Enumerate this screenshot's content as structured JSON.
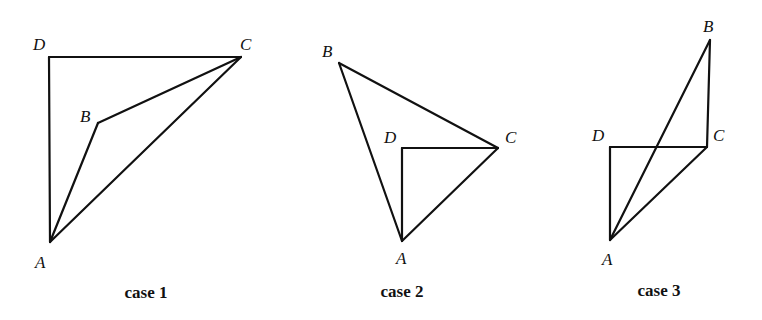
{
  "figure": {
    "cases": [
      {
        "caption": "case 1",
        "caption_pos": [
          146,
          298
        ],
        "points": {
          "A": [
            50,
            242
          ],
          "B": [
            98,
            123
          ],
          "C": [
            241,
            57
          ],
          "D": [
            49,
            57
          ]
        },
        "labels": {
          "A": {
            "text": "A",
            "pos": [
              35,
              268
            ]
          },
          "B": {
            "text": "B",
            "pos": [
              80,
              122
            ]
          },
          "C": {
            "text": "C",
            "pos": [
              240,
              50
            ]
          },
          "D": {
            "text": "D",
            "pos": [
              33,
              50
            ]
          }
        },
        "edges": [
          [
            "D",
            "C"
          ],
          [
            "D",
            "A"
          ],
          [
            "A",
            "B"
          ],
          [
            "B",
            "C"
          ],
          [
            "A",
            "C"
          ]
        ]
      },
      {
        "caption": "case 2",
        "caption_pos": [
          402,
          297
        ],
        "points": {
          "A": [
            402,
            241
          ],
          "B": [
            339,
            63
          ],
          "C": [
            498,
            148
          ],
          "D": [
            402,
            148
          ]
        },
        "labels": {
          "A": {
            "text": "A",
            "pos": [
              396,
              264
            ]
          },
          "B": {
            "text": "B",
            "pos": [
              322,
              57
            ]
          },
          "C": {
            "text": "C",
            "pos": [
              505,
              143
            ]
          },
          "D": {
            "text": "D",
            "pos": [
              384,
              143
            ]
          }
        },
        "edges": [
          [
            "B",
            "C"
          ],
          [
            "B",
            "A"
          ],
          [
            "D",
            "C"
          ],
          [
            "D",
            "A"
          ],
          [
            "A",
            "C"
          ]
        ]
      },
      {
        "caption": "case 3",
        "caption_pos": [
          659,
          296
        ],
        "points": {
          "A": [
            610,
            240
          ],
          "B": [
            710,
            40
          ],
          "C": [
            707,
            147
          ],
          "D": [
            610,
            147
          ]
        },
        "labels": {
          "A": {
            "text": "A",
            "pos": [
              602,
              265
            ]
          },
          "B": {
            "text": "B",
            "pos": [
              703,
              32
            ]
          },
          "C": {
            "text": "C",
            "pos": [
              713,
              141
            ]
          },
          "D": {
            "text": "D",
            "pos": [
              592,
              141
            ]
          }
        },
        "edges": [
          [
            "D",
            "C"
          ],
          [
            "D",
            "A"
          ],
          [
            "B",
            "C"
          ],
          [
            "A",
            "B"
          ],
          [
            "A",
            "C"
          ]
        ]
      }
    ]
  }
}
